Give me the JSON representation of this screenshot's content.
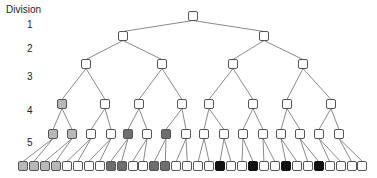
{
  "axis": {
    "title": "Division",
    "levels": [
      {
        "label": "1",
        "y": 25
      },
      {
        "label": "2",
        "y": 49
      },
      {
        "label": "3",
        "y": 77
      },
      {
        "label": "4",
        "y": 111
      },
      {
        "label": "5",
        "y": 143
      }
    ]
  },
  "colors": {
    "white": "#ffffff",
    "light_grey": "#b8b8b8",
    "dark_grey": "#6e6e6e",
    "black": "#111111",
    "edge": "#8a8a8a",
    "border": "#555555"
  },
  "tree": {
    "levels": [
      {
        "y": 16,
        "nodes": [
          {
            "x": 193,
            "fill": "white"
          }
        ]
      },
      {
        "y": 36,
        "nodes": [
          {
            "x": 123,
            "fill": "white"
          },
          {
            "x": 264,
            "fill": "white"
          }
        ]
      },
      {
        "y": 64,
        "nodes": [
          {
            "x": 86,
            "fill": "white"
          },
          {
            "x": 162,
            "fill": "white"
          },
          {
            "x": 233,
            "fill": "white"
          },
          {
            "x": 303,
            "fill": "white"
          }
        ]
      },
      {
        "y": 104,
        "nodes": [
          {
            "x": 62,
            "fill": "light_grey"
          },
          {
            "x": 105,
            "fill": "white"
          },
          {
            "x": 139,
            "fill": "white"
          },
          {
            "x": 182,
            "fill": "white"
          },
          {
            "x": 209,
            "fill": "white"
          },
          {
            "x": 253,
            "fill": "white"
          },
          {
            "x": 287,
            "fill": "white"
          },
          {
            "x": 331,
            "fill": "white"
          }
        ]
      },
      {
        "y": 134,
        "nodes": [
          {
            "x": 53,
            "fill": "light_grey"
          },
          {
            "x": 72,
            "fill": "light_grey"
          },
          {
            "x": 91,
            "fill": "white"
          },
          {
            "x": 111,
            "fill": "white"
          },
          {
            "x": 128,
            "fill": "dark_grey"
          },
          {
            "x": 147,
            "fill": "white"
          },
          {
            "x": 166,
            "fill": "dark_grey"
          },
          {
            "x": 186,
            "fill": "white"
          },
          {
            "x": 204,
            "fill": "white"
          },
          {
            "x": 224,
            "fill": "white"
          },
          {
            "x": 243,
            "fill": "white"
          },
          {
            "x": 263,
            "fill": "white"
          },
          {
            "x": 281,
            "fill": "white"
          },
          {
            "x": 300,
            "fill": "white"
          },
          {
            "x": 319,
            "fill": "white"
          },
          {
            "x": 339,
            "fill": "white"
          }
        ]
      },
      {
        "y": 166,
        "start_x": 23,
        "pitch": 10.95,
        "fills": [
          "light_grey",
          "light_grey",
          "light_grey",
          "light_grey",
          "white",
          "white",
          "white",
          "white",
          "dark_grey",
          "dark_grey",
          "white",
          "white",
          "dark_grey",
          "dark_grey",
          "white",
          "white",
          "white",
          "white",
          "black",
          "white",
          "white",
          "black",
          "white",
          "white",
          "black",
          "white",
          "white",
          "black",
          "white",
          "white",
          "white",
          "white"
        ]
      }
    ]
  }
}
